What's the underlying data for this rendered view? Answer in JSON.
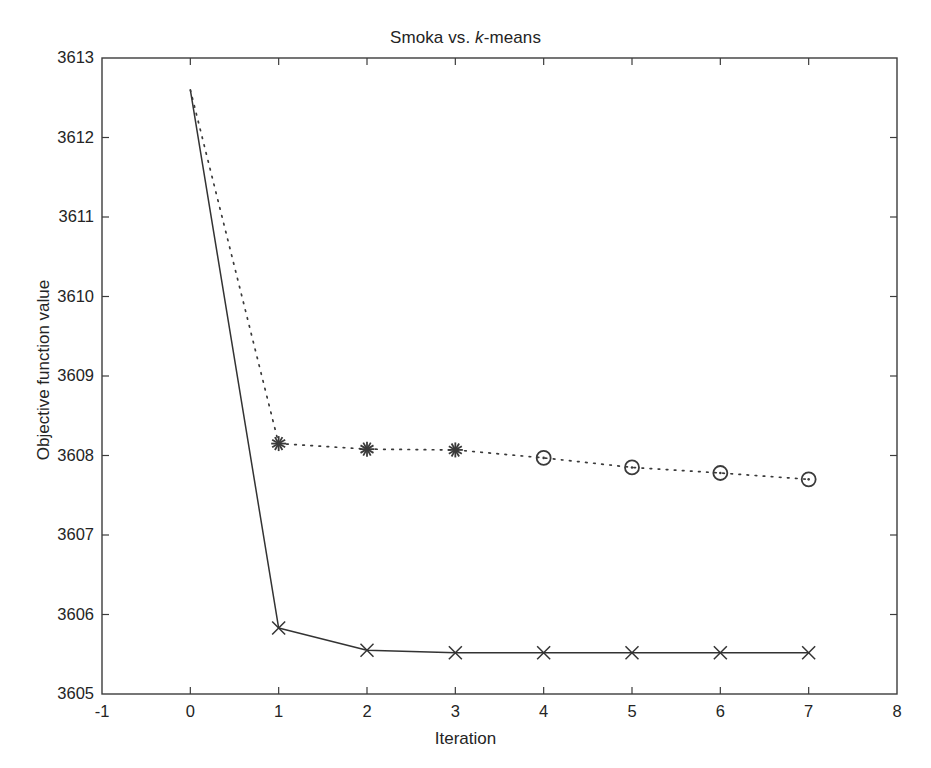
{
  "chart_data": {
    "type": "line",
    "title": "Smoka vs. k-means",
    "title_parts": {
      "before": "Smoka vs. ",
      "italic": "k",
      "after": "-means"
    },
    "xlabel": "Iteration",
    "ylabel": "Objective function value",
    "xlim": [
      -1,
      8
    ],
    "ylim": [
      3605,
      3613
    ],
    "xticks": [
      -1,
      0,
      1,
      2,
      3,
      4,
      5,
      6,
      7,
      8
    ],
    "xticklabels": [
      "-1",
      "0",
      "1",
      "2",
      "3",
      "4",
      "5",
      "6",
      "7",
      "8"
    ],
    "yticks": [
      3605,
      3606,
      3607,
      3608,
      3609,
      3610,
      3611,
      3612,
      3613
    ],
    "yticklabels": [
      "3605",
      "3606",
      "3607",
      "3608",
      "3609",
      "3610",
      "3611",
      "3612",
      "3613"
    ],
    "grid": false,
    "legend": null,
    "x": [
      0,
      1,
      2,
      3,
      4,
      5,
      6,
      7
    ],
    "series": [
      {
        "name": "Smoka",
        "linestyle": "solid",
        "marker": "x",
        "color": "#333333",
        "values": [
          3612.6,
          3605.83,
          3605.55,
          3605.52,
          3605.52,
          3605.52,
          3605.52,
          3605.52
        ],
        "marker_at": [
          1,
          2,
          3,
          4,
          5,
          6,
          7
        ]
      },
      {
        "name": "k-means",
        "linestyle": "dotted",
        "marker": "star-then-circle",
        "color": "#3a3a3a",
        "values": [
          3612.6,
          3608.15,
          3608.08,
          3608.07,
          3607.97,
          3607.85,
          3607.78,
          3607.7
        ],
        "star_marker_at": [
          1,
          2,
          3
        ],
        "circle_marker_at": [
          4,
          5,
          6,
          7
        ]
      }
    ]
  },
  "figure": {
    "background_color": "#ffffff",
    "axis_color": "#3c3c3c",
    "text_color": "#242424"
  }
}
